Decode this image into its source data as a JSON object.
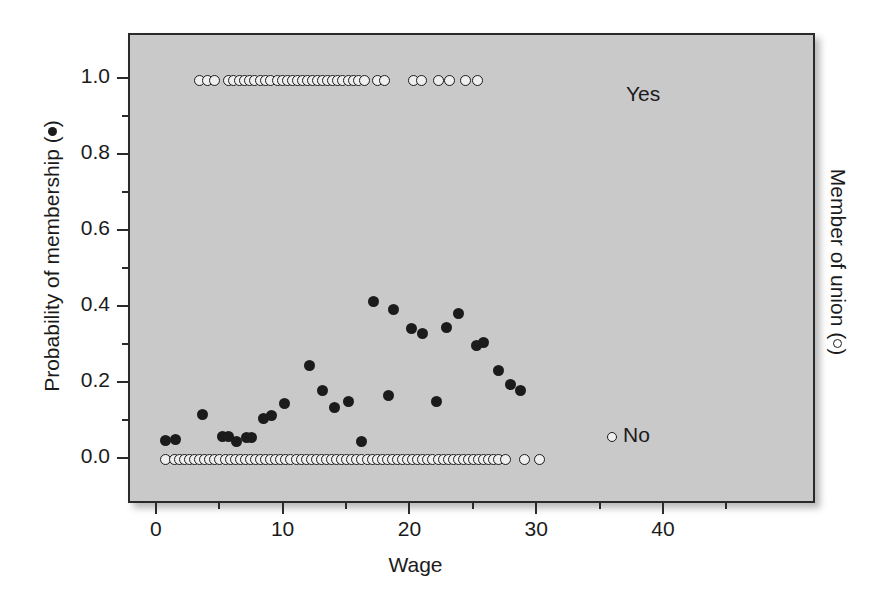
{
  "chart_data": {
    "type": "scatter",
    "title": "",
    "xlabel": "Wage",
    "ylabel_prefix": "Probability of membership (",
    "ylabel_suffix": ")",
    "ylabel_marker": "filled-circle",
    "y2label_prefix": "Member of union (",
    "y2label_suffix": ")",
    "y2label_marker": "open-circle",
    "xlim": [
      -2.2,
      52.0
    ],
    "ylim": [
      -0.12,
      1.12
    ],
    "xticks": [
      0,
      10,
      20,
      30,
      40
    ],
    "xtick_labels": [
      "0",
      "10",
      "20",
      "30",
      "40"
    ],
    "xminor_ticks": [
      5,
      15,
      25,
      35,
      45
    ],
    "yticks": [
      0.0,
      0.2,
      0.4,
      0.6,
      0.8,
      1.0
    ],
    "ytick_labels": [
      "0.0",
      "0.2",
      "0.4",
      "0.6",
      "0.8",
      "1.0"
    ],
    "yminor_ticks": [
      0.1,
      0.3,
      0.5,
      0.7,
      0.9
    ],
    "grid": false,
    "legend_position": "inside-right",
    "panel_background": "#c9c9c9",
    "frame_color": "#2a2a2a",
    "marker_color": "#1b1b1b",
    "annotations": [
      {
        "text": "Yes",
        "x": 45.5,
        "y": 1.0
      },
      {
        "text": "No",
        "x": 45.5,
        "y": 0.0,
        "marker": "open-circle"
      }
    ],
    "series": [
      {
        "name": "Probability of membership",
        "marker": "filled-circle",
        "points": [
          [
            0.6,
            0.05
          ],
          [
            1.4,
            0.053
          ],
          [
            3.5,
            0.12
          ],
          [
            5.1,
            0.062
          ],
          [
            5.6,
            0.06
          ],
          [
            6.2,
            0.047
          ],
          [
            7.0,
            0.058
          ],
          [
            7.4,
            0.058
          ],
          [
            8.3,
            0.108
          ],
          [
            9.0,
            0.117
          ],
          [
            10.0,
            0.148
          ],
          [
            12.0,
            0.248
          ],
          [
            13.0,
            0.182
          ],
          [
            13.9,
            0.138
          ],
          [
            15.0,
            0.152
          ],
          [
            16.1,
            0.048
          ],
          [
            17.0,
            0.418
          ],
          [
            18.6,
            0.397
          ],
          [
            18.2,
            0.17
          ],
          [
            20.0,
            0.345
          ],
          [
            20.9,
            0.332
          ],
          [
            22.0,
            0.152
          ],
          [
            22.8,
            0.348
          ],
          [
            23.7,
            0.385
          ],
          [
            25.1,
            0.3
          ],
          [
            25.7,
            0.31
          ],
          [
            26.9,
            0.235
          ],
          [
            27.8,
            0.197
          ],
          [
            28.6,
            0.182
          ]
        ]
      },
      {
        "name": "Member of union = Yes",
        "marker": "open-circle",
        "y": 1.0,
        "x_values": [
          3.3,
          3.9,
          4.5,
          5.6,
          6.0,
          6.4,
          6.8,
          7.2,
          7.6,
          8.1,
          8.5,
          8.9,
          9.4,
          9.8,
          10.2,
          10.6,
          11.0,
          11.4,
          11.8,
          12.2,
          12.6,
          13.0,
          13.4,
          13.8,
          14.2,
          14.6,
          15.0,
          15.4,
          15.8,
          16.3,
          17.3,
          17.9,
          20.2,
          20.8,
          22.1,
          23.0,
          24.3,
          25.2
        ]
      },
      {
        "name": "Member of union = No",
        "marker": "open-circle",
        "y": 0.0,
        "x_values": [
          0.6,
          1.3,
          1.7,
          2.1,
          2.5,
          2.9,
          3.3,
          3.7,
          4.1,
          4.5,
          4.9,
          5.3,
          5.7,
          6.1,
          6.5,
          6.9,
          7.3,
          7.7,
          8.1,
          8.5,
          8.9,
          9.3,
          9.7,
          10.1,
          10.5,
          10.9,
          11.3,
          11.7,
          12.1,
          12.5,
          12.9,
          13.3,
          13.7,
          14.1,
          14.5,
          14.9,
          15.3,
          15.7,
          16.1,
          16.5,
          16.9,
          17.3,
          17.7,
          18.1,
          18.5,
          18.9,
          19.3,
          19.7,
          20.1,
          20.5,
          20.9,
          21.3,
          21.7,
          22.1,
          22.5,
          22.9,
          23.3,
          23.7,
          24.1,
          24.5,
          24.9,
          25.3,
          25.7,
          26.1,
          26.5,
          26.9,
          27.4,
          28.9,
          30.1
        ]
      }
    ]
  }
}
